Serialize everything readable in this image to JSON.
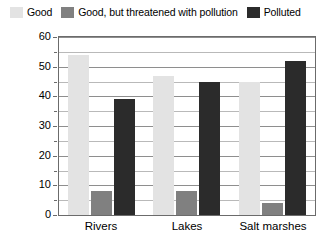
{
  "legend": {
    "position": "top",
    "entries": [
      {
        "label": "Good",
        "color": "#e3e3e3"
      },
      {
        "label": "Good, but threatened with pollution",
        "color": "#808080"
      },
      {
        "label": "Polluted",
        "color": "#2b2b2b"
      }
    ]
  },
  "axis": {
    "ylabel_main": "Percentage of water body",
    "ylabel_sub": "(of those tested for pollution)",
    "ticks": [
      "0",
      "10",
      "20",
      "30",
      "40",
      "50",
      "60"
    ]
  },
  "chart_data": {
    "type": "bar",
    "title": "",
    "subtitle": "",
    "xlabel": "",
    "ylabel": "Percentage of water body (of those tested for pollution)",
    "categories": [
      "Rivers",
      "Lakes",
      "Salt marshes"
    ],
    "series": [
      {
        "name": "Good",
        "color": "#e3e3e3",
        "values": [
          54,
          47,
          45
        ]
      },
      {
        "name": "Good, but threatened with pollution",
        "color": "#808080",
        "values": [
          8,
          8,
          4
        ]
      },
      {
        "name": "Polluted",
        "color": "#2b2b2b",
        "values": [
          39,
          45,
          52
        ]
      }
    ],
    "ylim": [
      0,
      60
    ],
    "ytick_step": 10,
    "yminor_step": 5,
    "grid": true,
    "legend_position": "top"
  },
  "colors": {
    "good": "#e3e3e3",
    "threatened": "#808080",
    "polluted": "#2b2b2b",
    "axis": "#6b6b6b",
    "grid_minor": "#b9b9b9",
    "grid_major": "#8e8e8e",
    "background": "#ffffff"
  }
}
